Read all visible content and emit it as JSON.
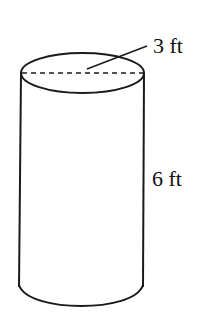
{
  "figure": {
    "shape": "cylinder",
    "diameter_label": "3 ft",
    "height_label": "6 ft",
    "colors": {
      "stroke": "#1a1a1a",
      "background": "#ffffff"
    }
  }
}
